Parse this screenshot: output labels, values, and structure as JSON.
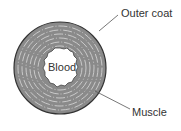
{
  "diagram": {
    "center_label": "Blood",
    "labels": {
      "outer_coat": "Outer coat",
      "muscle": "Muscle"
    },
    "colors": {
      "wall_fill": "#8a8a8a",
      "ring_lines": "#cfcfcf",
      "outline": "#333333",
      "lumen": "#ffffff"
    }
  }
}
